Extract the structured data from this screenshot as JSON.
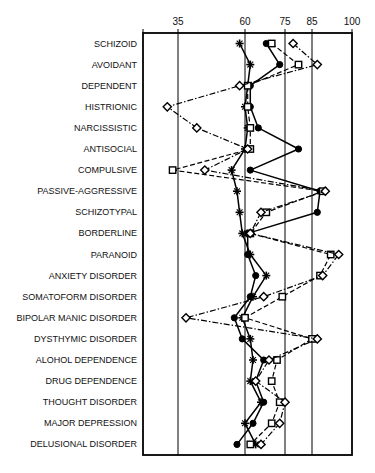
{
  "chart_data": {
    "type": "line",
    "title": "",
    "subtitle": "",
    "xlabel": "",
    "ylabel": "",
    "orientation": "horizontal",
    "grid": true,
    "legend_position": "none",
    "xlim": [
      20,
      100
    ],
    "xticks": [
      35,
      60,
      75,
      85,
      100
    ],
    "xtick_labels": [
      "35",
      "60",
      "75",
      "85",
      "100"
    ],
    "xtick_positions_px": [
      178,
      245,
      285,
      312,
      352
    ],
    "axis_note": "non-linear / unequally spaced tick scale",
    "categories": [
      "SCHIZOID",
      "AVOIDANT",
      "DEPENDENT",
      "HISTRIONIC",
      "NARCISSISTIC",
      "ANTISOCIAL",
      "COMPULSIVE",
      "PASSIVE-AGGRESSIVE",
      "SCHIZOTYPAL",
      "BORDERLINE",
      "PARANOID",
      "ANXIETY DISORDER",
      "SOMATOFORM DISORDER",
      "BIPOLAR MANIC DISORDER",
      "DYSTHYMIC DISORDER",
      "ALOHOL DEPENDENCE",
      "DRUG DEPENDENCE",
      "THOUGHT DISORDER",
      "MAJOR DEPRESSION",
      "DELUSIONAL DISORDER"
    ],
    "series": [
      {
        "name": "series-plus",
        "marker": "plus",
        "line_style": "solid",
        "values": [
          58,
          62,
          61,
          60,
          61,
          60,
          55,
          57,
          58,
          59,
          62,
          68,
          63,
          59,
          62,
          63,
          62,
          66,
          60,
          64
        ]
      },
      {
        "name": "series-circle",
        "marker": "filled-circle",
        "line_style": "solid",
        "values": [
          68,
          73,
          62,
          62,
          65,
          80,
          62,
          88,
          87,
          61,
          61,
          64,
          62,
          56,
          59,
          67,
          64,
          67,
          63,
          57
        ]
      },
      {
        "name": "series-square",
        "marker": "open-square",
        "line_style": "dashed",
        "values": [
          70,
          80,
          61,
          61,
          62,
          62,
          33,
          89,
          68,
          62,
          92,
          88,
          74,
          60,
          85,
          72,
          70,
          73,
          70,
          62
        ]
      },
      {
        "name": "series-diamond",
        "marker": "open-diamond",
        "line_style": "dash-dot",
        "values": [
          78,
          87,
          58,
          31,
          42,
          61,
          45,
          90,
          66,
          62,
          95,
          89,
          67,
          38,
          87,
          69,
          64,
          75,
          73,
          66
        ]
      }
    ]
  },
  "plot": {
    "frame": {
      "left_px": 143,
      "right_px": 352,
      "top_px": 33,
      "bottom_px": 455
    },
    "row_height_px": 21.1,
    "first_row_center_px": 43.5,
    "colors": {
      "ink": "#000000",
      "frame": "#000000",
      "background": "#ffffff"
    }
  }
}
